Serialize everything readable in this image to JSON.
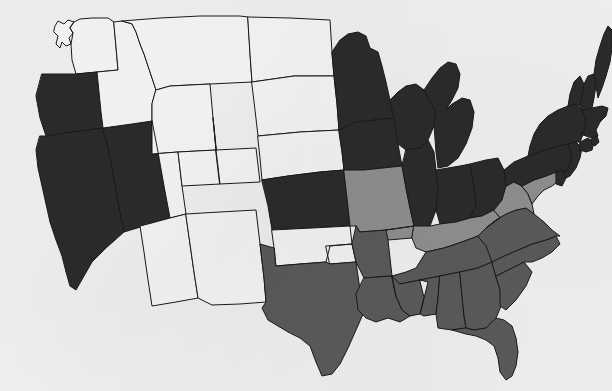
{
  "figure": {
    "kind": "choropleth-map",
    "region": "United States (lower 48)",
    "background_color": "#f0f0f0",
    "border_color": "#1a1a1a"
  },
  "legend": {
    "shown_in_image": false,
    "categories": [
      {
        "key": "none",
        "label": "None",
        "color": "#f5f5f5"
      },
      {
        "key": "light",
        "label": "Light",
        "color": "#8f8f8f"
      },
      {
        "key": "medium",
        "label": "Medium",
        "color": "#5a5a5a"
      },
      {
        "key": "dark",
        "label": "Dark",
        "color": "#2b2b2b"
      }
    ]
  },
  "chart_data": {
    "type": "heatmap",
    "title": "",
    "xlabel": "",
    "ylabel": "",
    "legend_position": "none",
    "grid": false,
    "value_scale": {
      "none": 0,
      "light": 1,
      "medium": 2,
      "dark": 3
    },
    "categories": [
      "Washington",
      "Oregon",
      "California",
      "Nevada",
      "Idaho",
      "Montana",
      "Wyoming",
      "Utah",
      "Arizona",
      "Colorado",
      "New Mexico",
      "North Dakota",
      "South Dakota",
      "Nebraska",
      "Kansas",
      "Oklahoma",
      "Texas",
      "Minnesota",
      "Iowa",
      "Missouri",
      "Arkansas",
      "Louisiana",
      "Wisconsin",
      "Illinois",
      "Michigan",
      "Indiana",
      "Ohio",
      "Kentucky",
      "Tennessee",
      "Mississippi",
      "Alabama",
      "Georgia",
      "Florida",
      "South Carolina",
      "North Carolina",
      "Virginia",
      "West Virginia",
      "Maryland",
      "Delaware",
      "Pennsylvania",
      "New Jersey",
      "New York",
      "Connecticut",
      "Rhode Island",
      "Massachusetts",
      "Vermont",
      "New Hampshire",
      "Maine"
    ],
    "values": [
      0,
      3,
      3,
      3,
      0,
      0,
      0,
      0,
      0,
      0,
      0,
      0,
      0,
      0,
      3,
      0,
      2,
      3,
      3,
      1,
      2,
      2,
      3,
      3,
      3,
      3,
      3,
      1,
      2,
      2,
      2,
      2,
      2,
      2,
      2,
      2,
      1,
      1,
      3,
      3,
      3,
      3,
      3,
      3,
      3,
      3,
      3,
      3
    ]
  },
  "states": [
    {
      "id": "WA",
      "name": "Washington",
      "shade": "none",
      "color": "#f5f5f5"
    },
    {
      "id": "OR",
      "name": "Oregon",
      "shade": "dark",
      "color": "#2b2b2b"
    },
    {
      "id": "CA",
      "name": "California",
      "shade": "dark",
      "color": "#2b2b2b"
    },
    {
      "id": "NV",
      "name": "Nevada",
      "shade": "dark",
      "color": "#2b2b2b"
    },
    {
      "id": "ID",
      "name": "Idaho",
      "shade": "none",
      "color": "#f5f5f5"
    },
    {
      "id": "MT",
      "name": "Montana",
      "shade": "none",
      "color": "#f5f5f5"
    },
    {
      "id": "WY",
      "name": "Wyoming",
      "shade": "none",
      "color": "#f5f5f5"
    },
    {
      "id": "UT",
      "name": "Utah",
      "shade": "none",
      "color": "#f5f5f5"
    },
    {
      "id": "AZ",
      "name": "Arizona",
      "shade": "none",
      "color": "#f5f5f5"
    },
    {
      "id": "CO",
      "name": "Colorado",
      "shade": "none",
      "color": "#f5f5f5"
    },
    {
      "id": "NM",
      "name": "New Mexico",
      "shade": "none",
      "color": "#f5f5f5"
    },
    {
      "id": "ND",
      "name": "North Dakota",
      "shade": "none",
      "color": "#f5f5f5"
    },
    {
      "id": "SD",
      "name": "South Dakota",
      "shade": "none",
      "color": "#f5f5f5"
    },
    {
      "id": "NE",
      "name": "Nebraska",
      "shade": "none",
      "color": "#f5f5f5"
    },
    {
      "id": "KS",
      "name": "Kansas",
      "shade": "dark",
      "color": "#2b2b2b"
    },
    {
      "id": "OK",
      "name": "Oklahoma",
      "shade": "none",
      "color": "#f5f5f5"
    },
    {
      "id": "TX",
      "name": "Texas",
      "shade": "medium",
      "color": "#5a5a5a"
    },
    {
      "id": "MN",
      "name": "Minnesota",
      "shade": "dark",
      "color": "#2b2b2b"
    },
    {
      "id": "IA",
      "name": "Iowa",
      "shade": "dark",
      "color": "#2b2b2b"
    },
    {
      "id": "MO",
      "name": "Missouri",
      "shade": "light",
      "color": "#8f8f8f"
    },
    {
      "id": "AR",
      "name": "Arkansas",
      "shade": "medium",
      "color": "#5a5a5a"
    },
    {
      "id": "LA",
      "name": "Louisiana",
      "shade": "medium",
      "color": "#5a5a5a"
    },
    {
      "id": "WI",
      "name": "Wisconsin",
      "shade": "dark",
      "color": "#2b2b2b"
    },
    {
      "id": "IL",
      "name": "Illinois",
      "shade": "dark",
      "color": "#2b2b2b"
    },
    {
      "id": "MI",
      "name": "Michigan",
      "shade": "dark",
      "color": "#2b2b2b"
    },
    {
      "id": "IN",
      "name": "Indiana",
      "shade": "dark",
      "color": "#2b2b2b"
    },
    {
      "id": "OH",
      "name": "Ohio",
      "shade": "dark",
      "color": "#2b2b2b"
    },
    {
      "id": "KY",
      "name": "Kentucky",
      "shade": "light",
      "color": "#8f8f8f"
    },
    {
      "id": "TN",
      "name": "Tennessee",
      "shade": "medium",
      "color": "#5a5a5a"
    },
    {
      "id": "MS",
      "name": "Mississippi",
      "shade": "medium",
      "color": "#5a5a5a"
    },
    {
      "id": "AL",
      "name": "Alabama",
      "shade": "medium",
      "color": "#5a5a5a"
    },
    {
      "id": "GA",
      "name": "Georgia",
      "shade": "medium",
      "color": "#5a5a5a"
    },
    {
      "id": "FL",
      "name": "Florida",
      "shade": "medium",
      "color": "#5a5a5a"
    },
    {
      "id": "SC",
      "name": "South Carolina",
      "shade": "medium",
      "color": "#5a5a5a"
    },
    {
      "id": "NC",
      "name": "North Carolina",
      "shade": "medium",
      "color": "#5a5a5a"
    },
    {
      "id": "VA",
      "name": "Virginia",
      "shade": "medium",
      "color": "#5a5a5a"
    },
    {
      "id": "WV",
      "name": "West Virginia",
      "shade": "light",
      "color": "#8f8f8f"
    },
    {
      "id": "MD",
      "name": "Maryland",
      "shade": "light",
      "color": "#8f8f8f"
    },
    {
      "id": "DE",
      "name": "Delaware",
      "shade": "dark",
      "color": "#2b2b2b"
    },
    {
      "id": "PA",
      "name": "Pennsylvania",
      "shade": "dark",
      "color": "#2b2b2b"
    },
    {
      "id": "NJ",
      "name": "New Jersey",
      "shade": "dark",
      "color": "#2b2b2b"
    },
    {
      "id": "NY",
      "name": "New York",
      "shade": "dark",
      "color": "#2b2b2b"
    },
    {
      "id": "CT",
      "name": "Connecticut",
      "shade": "dark",
      "color": "#2b2b2b"
    },
    {
      "id": "RI",
      "name": "Rhode Island",
      "shade": "dark",
      "color": "#2b2b2b"
    },
    {
      "id": "MA",
      "name": "Massachusetts",
      "shade": "dark",
      "color": "#2b2b2b"
    },
    {
      "id": "VT",
      "name": "Vermont",
      "shade": "dark",
      "color": "#2b2b2b"
    },
    {
      "id": "NH",
      "name": "New Hampshire",
      "shade": "dark",
      "color": "#2b2b2b"
    },
    {
      "id": "ME",
      "name": "Maine",
      "shade": "dark",
      "color": "#2b2b2b"
    }
  ],
  "geometry": {
    "WA": "M55,26 L58,21 L64,24 L68,20 L74,22 L70,28 L73,33 L69,38 L71,44 L66,46 L62,42 L60,48 L56,44 L58,36 L54,32 Z M74,22 L80,19 L92,18 L108,18 L114,22 L116,47 L118,70 L97,72 L76,74 L72,60 L71,44 L73,33 L70,28 Z",
    "OR": "M42,74 L76,74 L97,72 L99,92 L101,112 L103,128 L72,132 L46,136 L40,118 L36,96 Z",
    "CA": "M40,136 L46,136 L72,132 L103,128 L108,148 L112,168 L116,190 L120,212 L124,232 L106,248 L92,262 L84,276 L76,290 L70,286 L66,272 L62,256 L56,240 L50,222 L46,204 L42,186 L38,168 L36,150 Z",
    "NV": "M103,128 L132,124 L152,121 L158,152 L164,186 L170,218 L124,232 L120,212 L116,190 L112,168 L108,148 Z",
    "ID": "M114,22 L122,21 L132,24 L136,32 L140,44 L144,54 L148,66 L152,78 L156,90 L152,104 L152,121 L132,124 L103,128 L101,112 L99,92 L97,72 L118,70 L116,47 Z",
    "MT": "M122,21 L160,18 L200,16 L240,16 L248,17 L250,54 L252,82 L210,84 L170,86 L156,90 L152,78 L148,66 L144,54 L140,44 L136,32 L132,24 Z",
    "WY": "M156,90 L170,86 L210,84 L213,118 L216,150 L178,152 L152,154 L152,121 L152,104 Z",
    "UT": "M152,121 L152,154 L178,152 L182,186 L186,214 L170,218 L164,186 L158,152 Z",
    "AZ": "M170,218 L186,214 L190,244 L194,272 L198,298 L176,302 L152,306 L148,280 L144,252 L140,226 L148,224 Z",
    "CO": "M213,118 L216,150 L220,184 L182,186 L178,152 L216,150 Z M216,150 L256,148 L260,182 L220,184 Z",
    "NM": "M186,214 L220,212 L256,210 L260,244 L264,278 L266,302 L240,304 L212,305 L198,298 L194,272 L190,244 Z",
    "ND": "M248,17 L290,18 L330,20 L332,52 L334,76 L294,76 L252,82 L250,54 Z",
    "SD": "M252,82 L294,76 L334,76 L337,104 L339,130 L300,132 L258,136 L255,110 Z",
    "NE": "M258,136 L300,132 L339,130 L342,152 L344,170 L320,172 L288,176 L262,180 L260,158 Z",
    "KS": "M262,180 L288,176 L320,172 L344,170 L347,198 L350,226 L312,228 L272,230 L268,206 Z",
    "OK": "M272,230 L312,228 L350,226 L352,244 L330,246 L326,262 L300,264 L276,266 L274,248 Z M326,246 L352,244 L356,262 L330,264 Z",
    "TX": "M276,266 L300,264 L326,262 L330,264 L356,262 L360,290 L364,312 L356,330 L348,348 L340,364 L332,374 L322,376 L316,362 L310,346 L300,338 L288,332 L278,326 L268,320 L262,308 L266,302 L264,278 L260,244 L274,248 Z",
    "MN": "M332,52 L340,40 L348,34 L358,32 L366,36 L370,48 L378,52 L382,66 L386,82 L390,100 L394,118 L356,122 L339,130 L337,104 L334,76 Z",
    "IA": "M339,130 L356,122 L394,118 L398,144 L402,166 L364,170 L344,170 L342,152 Z",
    "MO": "M344,170 L364,170 L402,166 L406,188 L410,208 L414,226 L386,230 L360,232 L356,226 L350,226 L347,198 Z M386,230 L414,226 L412,238 L388,240 Z",
    "AR": "M360,232 L386,230 L388,240 L390,258 L392,276 L364,278 L356,262 L352,244 L356,226 Z",
    "LA": "M364,278 L392,276 L396,296 L402,310 L410,316 L400,322 L388,318 L376,322 L366,318 L358,310 L356,294 Z",
    "WI": "M390,100 L398,92 L406,86 L416,84 L424,90 L430,102 L436,112 L434,126 L428,140 L420,148 L406,150 L398,144 L394,118 Z",
    "IL": "M406,150 L420,148 L428,140 L434,152 L436,170 L438,190 L436,210 L430,226 L420,234 L414,226 L410,208 L406,188 L402,166 Z",
    "MI": "M424,90 L432,78 L440,68 L448,62 L456,64 L460,74 L458,88 L452,100 L446,110 L452,104 L462,98 L470,100 L474,112 L472,128 L466,144 L458,158 L448,166 L438,168 L436,152 L434,126 L436,112 L430,102 Z",
    "IN": "M436,170 L460,166 L470,164 L474,186 L476,206 L470,218 L456,222 L440,224 L436,210 L438,190 Z",
    "OH": "M470,164 L486,160 L498,158 L504,170 L506,186 L502,200 L494,210 L482,216 L470,218 L476,206 L474,186 Z",
    "KY": "M414,226 L430,226 L440,224 L456,222 L470,218 L482,216 L494,210 L500,218 L492,228 L478,236 L462,242 L444,248 L426,252 L416,248 L412,238 Z",
    "TN": "M392,276 L406,272 L416,268 L426,252 L444,248 L462,242 L478,236 L486,246 L496,250 L492,262 L478,268 L460,272 L440,276 L420,280 L400,284 L396,296 Z",
    "MS": "M392,276 L396,296 L402,310 L410,316 L420,314 L424,298 L428,282 L420,280 L400,284 Z M420,280 L440,276 L438,298 L436,314 L424,316 L420,314 L424,298 Z",
    "AL": "M440,276 L460,272 L462,296 L464,316 L466,328 L452,330 L438,328 L436,314 L438,298 Z",
    "GA": "M460,272 L478,268 L492,262 L496,276 L500,290 L502,304 L496,318 L486,328 L474,330 L466,328 L464,316 L462,296 Z",
    "FL": "M466,328 L474,330 L486,328 L496,318 L504,320 L512,326 L516,338 L518,352 L516,366 L512,376 L506,380 L500,372 L498,358 L494,346 L486,340 L476,336 L466,334 L452,330 Z",
    "SC": "M496,276 L512,268 L524,262 L532,272 L526,286 L516,300 L506,310 L500,306 L500,290 Z",
    "NC": "M492,262 L504,256 L518,250 L532,244 L546,240 L556,236 L560,244 L552,252 L542,258 L532,262 L524,262 L512,268 L496,276 Z",
    "VA": "M478,236 L486,228 L496,220 L506,214 L516,210 L526,208 L534,214 L544,222 L552,230 L560,236 L556,236 L546,240 L532,244 L518,250 L504,256 L492,262 L486,246 Z",
    "WV": "M494,210 L502,200 L506,186 L514,182 L522,186 L528,194 L532,204 L534,214 L526,208 L516,210 L506,214 L496,220 L486,228 L500,218 Z",
    "MD": "M522,186 L534,180 L546,176 L556,172 L560,180 L552,186 L544,190 L538,196 L532,204 L528,194 Z",
    "DE": "M556,172 L562,170 L566,178 L562,186 L556,184 L556,180 Z",
    "PA": "M506,186 L504,170 L514,162 L528,156 L544,150 L558,146 L568,144 L572,154 L570,164 L566,172 L562,170 L556,172 L546,176 L534,180 L522,186 L514,182 Z",
    "NJ": "M568,144 L576,142 L582,148 L580,158 L576,168 L570,176 L566,178 L562,170 L566,172 L570,164 L572,154 Z",
    "NY": "M528,156 L530,146 L534,134 L540,124 L548,116 L558,110 L568,106 L576,104 L582,110 L586,120 L584,132 L580,142 L576,142 L568,144 L558,146 L544,150 Z",
    "CT": "M580,142 L588,138 L594,142 L592,150 L586,152 L580,150 Z",
    "RI": "M592,138 L597,136 L599,142 L595,146 L592,144 Z",
    "MA": "M582,110 L592,108 L602,106 L608,108 L606,116 L600,122 L596,130 L598,136 L592,138 L586,136 L580,134 L584,132 L586,120 Z",
    "VT": "M568,106 L570,94 L574,82 L580,76 L584,84 L582,96 L580,106 L576,104 Z",
    "NH": "M580,106 L582,96 L584,84 L588,76 L594,74 L596,86 L594,98 L592,108 L582,110 Z",
    "ME": "M594,74 L596,60 L600,46 L604,34 L608,26 L612,30 L612,48 L610,62 L606,76 L602,88 L598,98 L596,86 Z"
  }
}
